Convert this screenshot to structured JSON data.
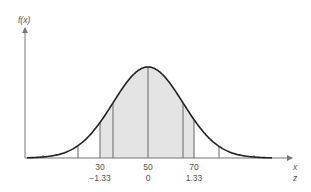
{
  "chart_data": {
    "type": "area",
    "title": "",
    "ylabel": "f(x)",
    "xlabel": "x",
    "xlabel2": "z",
    "mean": 50,
    "shaded_range": [
      30,
      70
    ],
    "x_ticks": [
      {
        "x": "30",
        "z": "−1.33"
      },
      {
        "x": "50",
        "z": "0"
      },
      {
        "x": "70",
        "z": "1.33"
      }
    ],
    "colors": {
      "curve": "#222222",
      "shade": "#e4e4e4",
      "axis": "#777777",
      "lines": "#555555"
    }
  },
  "labels": {
    "y_axis": "f(x)",
    "x_axis": "x",
    "z_axis": "z",
    "tick_30": "30",
    "tick_50": "50",
    "tick_70": "70",
    "z_neg": "−1.33",
    "z_0": "0",
    "z_pos": "1.33"
  }
}
